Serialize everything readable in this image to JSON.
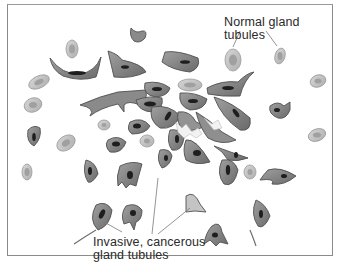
{
  "figure": {
    "labels": {
      "normal": "Normal gland tubules",
      "invasive_line1": "Invasive, cancerous",
      "invasive_line2": "gland tubules"
    },
    "colors": {
      "frame": "#8a8a8a",
      "normal_outer": "#c8c8c8",
      "normal_inner": "#a8a8a8",
      "cancer_outer": "#8c8c8c",
      "cancer_mid": "#6e6e6e",
      "nucleus": "#1e1e1e",
      "leader_line": "#7a7a7a",
      "background": "#ffffff"
    }
  }
}
